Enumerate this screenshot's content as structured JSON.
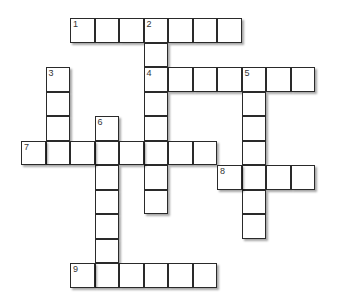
{
  "puzzle": {
    "cell_size": 24.5,
    "origin_x": 21,
    "origin_y": 18,
    "colors": {
      "border": "#2a2a2a",
      "cell": "#ffffff",
      "background": "#ffffff",
      "number": "#333333"
    },
    "entries": [
      {
        "number": "1",
        "direction": "across",
        "row": 0,
        "col": 2,
        "length": 7
      },
      {
        "number": "2",
        "direction": "down",
        "row": 0,
        "col": 5,
        "length": 8
      },
      {
        "number": "3",
        "direction": "down",
        "row": 2,
        "col": 1,
        "length": 4
      },
      {
        "number": "4",
        "direction": "across",
        "row": 2,
        "col": 5,
        "length": 7
      },
      {
        "number": "5",
        "direction": "down",
        "row": 2,
        "col": 9,
        "length": 7
      },
      {
        "number": "6",
        "direction": "down",
        "row": 4,
        "col": 3,
        "length": 7
      },
      {
        "number": "7",
        "direction": "across",
        "row": 5,
        "col": 0,
        "length": 8
      },
      {
        "number": "8",
        "direction": "across",
        "row": 6,
        "col": 8,
        "length": 4
      },
      {
        "number": "9",
        "direction": "across",
        "row": 10,
        "col": 2,
        "length": 6
      }
    ]
  }
}
